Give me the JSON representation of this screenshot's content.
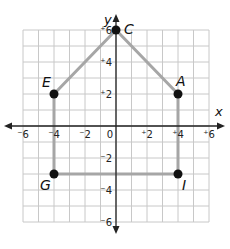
{
  "diagram": {
    "type": "coordinate-plane-polygon",
    "axes": {
      "x_label": "x",
      "y_label": "y",
      "x_range": [
        -6,
        6
      ],
      "y_range": [
        -6,
        6
      ],
      "x_ticks": [
        {
          "value": -6,
          "label": "⁻6"
        },
        {
          "value": -4,
          "label": "⁻4"
        },
        {
          "value": -2,
          "label": "⁻2"
        },
        {
          "value": 0,
          "label": "0"
        },
        {
          "value": 2,
          "label": "⁺2"
        },
        {
          "value": 4,
          "label": "⁺4"
        },
        {
          "value": 6,
          "label": "⁺6"
        }
      ],
      "y_ticks": [
        {
          "value": 6,
          "label": "⁺6"
        },
        {
          "value": 4,
          "label": "⁺4"
        },
        {
          "value": 2,
          "label": "⁺2"
        },
        {
          "value": -2,
          "label": "⁻2"
        },
        {
          "value": -4,
          "label": "⁻4"
        },
        {
          "value": -6,
          "label": "⁻6"
        }
      ]
    },
    "points": [
      {
        "name": "C",
        "x": 0,
        "y": 6
      },
      {
        "name": "A",
        "x": 4,
        "y": 2
      },
      {
        "name": "I",
        "x": 4,
        "y": -3
      },
      {
        "name": "G",
        "x": -4,
        "y": -3
      },
      {
        "name": "E",
        "x": -4,
        "y": 2
      }
    ],
    "polygon_order": [
      "C",
      "A",
      "I",
      "G",
      "E"
    ],
    "colors": {
      "grid": "#c8c8c8",
      "axis": "#222222",
      "edge": "#a6a6a6",
      "point": "#111111"
    }
  }
}
